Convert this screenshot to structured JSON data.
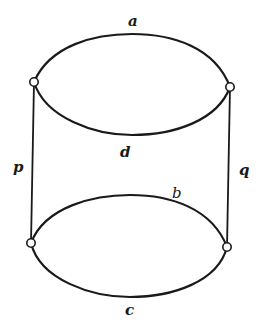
{
  "diagram": {
    "type": "graph",
    "vertices": [
      {
        "id": "top-left",
        "x": 34,
        "y": 82
      },
      {
        "id": "top-right",
        "x": 230,
        "y": 87
      },
      {
        "id": "bottom-left",
        "x": 31,
        "y": 243
      },
      {
        "id": "bottom-right",
        "x": 227,
        "y": 247
      }
    ],
    "edges": [
      {
        "label": "a",
        "from": "top-left",
        "to": "top-right",
        "shape": "upper arc of top ellipse"
      },
      {
        "label": "d",
        "from": "top-left",
        "to": "top-right",
        "shape": "lower arc of top ellipse"
      },
      {
        "label": "b",
        "from": "bottom-left",
        "to": "bottom-right",
        "shape": "upper arc of bottom ellipse"
      },
      {
        "label": "c",
        "from": "bottom-left",
        "to": "bottom-right",
        "shape": "lower arc of bottom ellipse"
      },
      {
        "label": "p",
        "from": "top-left",
        "to": "bottom-left",
        "shape": "vertical line"
      },
      {
        "label": "q",
        "from": "top-right",
        "to": "bottom-right",
        "shape": "vertical line"
      }
    ],
    "labels": {
      "a": "a",
      "d": "d",
      "b": "b",
      "c": "c",
      "p": "p",
      "q": "q"
    },
    "colors": {
      "stroke": "#1a1a1a",
      "background": "#ffffff",
      "vertex_fill": "#ffffff"
    }
  }
}
